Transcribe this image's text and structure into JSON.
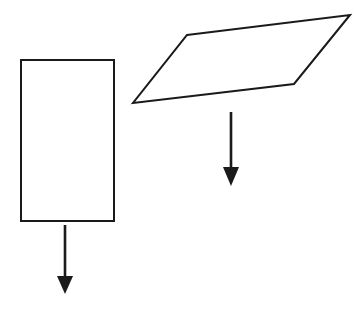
{
  "figure": {
    "background_color": "#ffffff",
    "stroke_color": "#1a1a1a",
    "canvas": {
      "width": 364,
      "height": 318
    },
    "shapes": [
      {
        "name": "rectangle",
        "kind": "rectangle",
        "fill": "#ffffff",
        "stroke": "#1a1a1a",
        "stroke_width": 2,
        "x": 21,
        "y": 60,
        "width": 93,
        "height": 161,
        "points": "21,60 114,60 114,221 21,221"
      },
      {
        "name": "parallelogram",
        "kind": "parallelogram",
        "fill": "#ffffff",
        "stroke": "#1a1a1a",
        "stroke_width": 2,
        "points": "187,35 350,15 294,84 133,103"
      }
    ],
    "arrows": [
      {
        "name": "rectangle-force-arrow",
        "direction": "down",
        "color": "#1a1a1a",
        "shaft_x": 65,
        "shaft_top_y": 225,
        "shaft_bottom_y": 278,
        "shaft_width": 2.6,
        "head_points": "57,276 73,276 65,294"
      },
      {
        "name": "parallelogram-force-arrow",
        "direction": "down",
        "color": "#1a1a1a",
        "shaft_x": 231,
        "shaft_top_y": 112,
        "shaft_bottom_y": 169,
        "shaft_width": 2.6,
        "head_points": "223,167 239,167 231,186"
      }
    ]
  }
}
